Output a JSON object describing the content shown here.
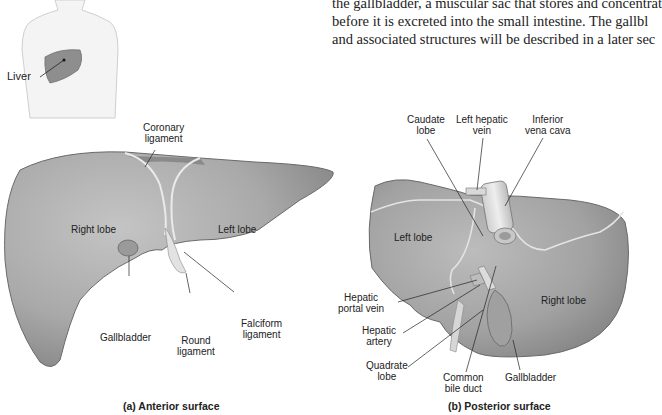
{
  "body_text": {
    "lines": [
      "the gallbladder, a muscular sac that stores and concentrat",
      "before it is excreted into the small intestine. The gallbl",
      "and associated structures will be described in a later sec"
    ]
  },
  "inset": {
    "label": "Liver"
  },
  "panel_a": {
    "caption": "(a) Anterior surface",
    "labels": {
      "coronary": [
        "Coronary",
        "ligament"
      ],
      "right_lobe": "Right lobe",
      "left_lobe": "Left lobe",
      "gallbladder": "Gallbladder",
      "round": [
        "Round",
        "ligament"
      ],
      "falciform": [
        "Falciform",
        "ligament"
      ]
    }
  },
  "panel_b": {
    "caption": "(b) Posterior surface",
    "labels": {
      "caudate": [
        "Caudate",
        "lobe"
      ],
      "left_hepatic_vein": [
        "Left hepatic",
        "vein"
      ],
      "ivc": [
        "Inferior",
        "vena cava"
      ],
      "left_lobe": "Left lobe",
      "right_lobe": "Right lobe",
      "portal_vein": [
        "Hepatic",
        "portal vein"
      ],
      "hepatic_artery": [
        "Hepatic",
        "artery"
      ],
      "quadrate": [
        "Quadrate",
        "lobe"
      ],
      "bile_duct": [
        "Common",
        "bile duct"
      ],
      "gallbladder": "Gallbladder"
    }
  },
  "colors": {
    "liver_fill": "#a8a8a8",
    "liver_dark": "#7a7a7a",
    "ligament": "#e6e6e6",
    "text": "#222222"
  }
}
